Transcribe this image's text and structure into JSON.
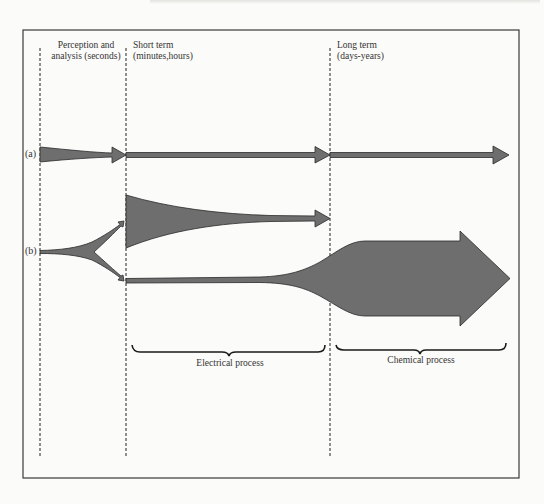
{
  "diagram": {
    "phases": [
      {
        "id": "perception",
        "line1": "Perception and",
        "line2": "analysis (seconds)"
      },
      {
        "id": "short",
        "line1": "Short term",
        "line2": "(minutes,hours)"
      },
      {
        "id": "long",
        "line1": "Long term",
        "line2": "(days-years)"
      }
    ],
    "rows": [
      {
        "id": "a",
        "label": "(a)"
      },
      {
        "id": "b",
        "label": "(b)"
      }
    ],
    "processes": [
      {
        "id": "electrical",
        "label": "Electrical process"
      },
      {
        "id": "chemical",
        "label": "Chemical process"
      }
    ],
    "colors": {
      "arrow_fill": "#6e6e6e",
      "arrow_stroke": "#2a2a2a",
      "frame": "#3a3a3a",
      "background": "#fbfbf9"
    }
  }
}
